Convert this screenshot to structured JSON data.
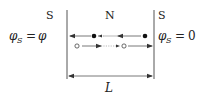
{
  "diagram": {
    "regions": {
      "left_label": "S",
      "middle_label": "N",
      "right_label": "S"
    },
    "boundary_conditions": {
      "left": {
        "symbol": "φ",
        "subscript": "S",
        "equals": "=",
        "value": "φ"
      },
      "right": {
        "symbol": "φ",
        "subscript": "S",
        "equals": "=",
        "value": "0"
      }
    },
    "length_label": "L",
    "particles": {
      "row1": {
        "type": "filled-dot",
        "direction": "left",
        "count": 2
      },
      "row2": {
        "type": "open-circle",
        "direction": "right",
        "count": 2
      }
    },
    "colors": {
      "line": "#555555",
      "text": "#222222"
    }
  }
}
